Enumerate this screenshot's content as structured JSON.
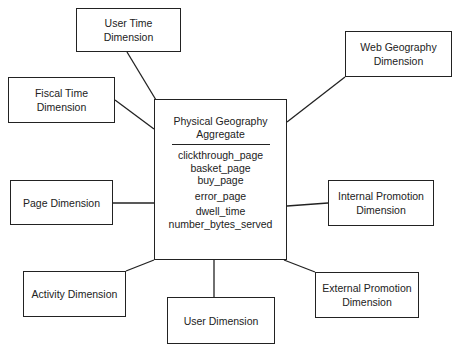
{
  "diagram": {
    "type": "star-schema",
    "center": {
      "title_line1": "Physical Geography",
      "title_line2": "Aggregate",
      "attributes": [
        "clickthrough_page",
        "basket_page",
        "buy_page",
        "error_page",
        "dwell_time",
        "number_bytes_served"
      ]
    },
    "dimensions": [
      {
        "id": "user-time",
        "line1": "User Time Dimension",
        "line2": ""
      },
      {
        "id": "fiscal-time",
        "line1": "Fiscal Time Dimension",
        "line2": ""
      },
      {
        "id": "web-geography",
        "line1": "Web Geography",
        "line2": "Dimension"
      },
      {
        "id": "page",
        "line1": "Page Dimension",
        "line2": ""
      },
      {
        "id": "internal-promotion",
        "line1": "Internal Promotion",
        "line2": "Dimension"
      },
      {
        "id": "activity",
        "line1": "Activity Dimension",
        "line2": ""
      },
      {
        "id": "user",
        "line1": "User Dimension",
        "line2": ""
      },
      {
        "id": "external-promotion",
        "line1": "External Promotion",
        "line2": "Dimension"
      }
    ]
  }
}
